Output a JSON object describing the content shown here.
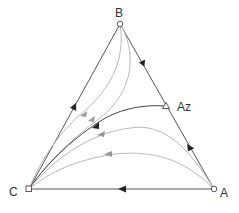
{
  "diagram": {
    "type": "ternary residue curve map",
    "vertices": {
      "B": {
        "label": "B",
        "marker": "circle"
      },
      "A": {
        "label": "A",
        "marker": "circle"
      },
      "C": {
        "label": "C",
        "marker": "square"
      }
    },
    "azeotrope": {
      "label": "Az",
      "marker": "triangle",
      "location": "on edge B-A"
    },
    "colors": {
      "edge": "#555555",
      "separatrix": "#333333",
      "curve": "#b0b0b0",
      "arrow_dark": "#222222",
      "arrow_light": "#999999"
    },
    "edges": [
      {
        "from": "B",
        "to": "C",
        "arrow": "toward C"
      },
      {
        "from": "B",
        "to": "Az",
        "arrow": "toward Az"
      },
      {
        "from": "A",
        "to": "Az",
        "arrow": "toward Az"
      },
      {
        "from": "A",
        "to": "C",
        "arrow": "toward C"
      }
    ],
    "curves": [
      {
        "from": "B",
        "to": "C",
        "style": "light"
      },
      {
        "from": "B",
        "to": "C",
        "style": "light"
      },
      {
        "from": "Az",
        "to": "C",
        "style": "dark (separatrix)"
      },
      {
        "from": "A",
        "to": "C",
        "style": "light"
      },
      {
        "from": "A",
        "to": "C",
        "style": "light"
      }
    ]
  }
}
